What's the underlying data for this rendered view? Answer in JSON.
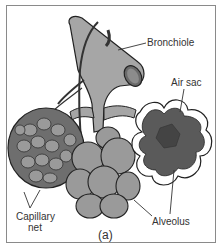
{
  "figure": {
    "caption": "(a)",
    "labels": {
      "bronchiole": "Bronchiole",
      "air_sac": "Air sac",
      "capillary_net_line1": "Capillary",
      "capillary_net_line2": "net",
      "alveolus": "Alveolus"
    },
    "colors": {
      "border": "#8a8a8a",
      "tube": "#a6a6a6",
      "alveolus_cluster": "#9a9a9a",
      "capillary": "#6e6e6e",
      "cross_section": "#5a5a5a",
      "outline": "#222222"
    }
  }
}
